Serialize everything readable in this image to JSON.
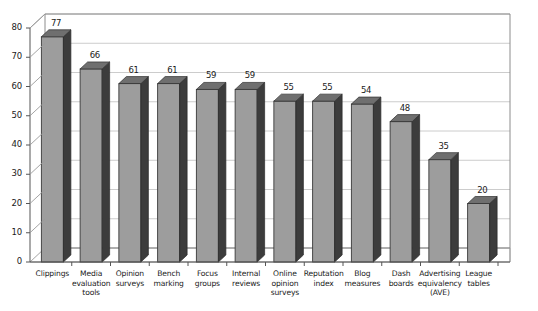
{
  "chart_data": {
    "type": "bar",
    "title": "",
    "subtitle": "",
    "xlabel": "",
    "ylabel": "",
    "ylim": [
      0,
      80
    ],
    "ytick_step": 10,
    "yticks": [
      "0",
      "10",
      "20",
      "30",
      "40",
      "50",
      "60",
      "70",
      "80"
    ],
    "grid": true,
    "legend": "none",
    "style": "3d-bar",
    "categories": [
      "Clippings",
      "Media\nevaluation\ntools",
      "Opinion\nsurveys",
      "Bench\nmarking",
      "Focus\ngroups",
      "Internal\nreviews",
      "Online\nopinion\nsurveys",
      "Reputation\nindex",
      "Blog\nmeasures",
      "Dash\nboards",
      "Advertising\nequivalency\n(AVE)",
      "League\ntables"
    ],
    "values": [
      77,
      66,
      61,
      61,
      59,
      59,
      55,
      55,
      54,
      48,
      35,
      20
    ],
    "value_labels": [
      "77",
      "66",
      "61",
      "61",
      "59",
      "59",
      "55",
      "55",
      "54",
      "48",
      "35",
      "20"
    ],
    "colors": {
      "bar_front": "#9d9d9d",
      "bar_side": "#3c3c3c",
      "bar_top": "#6f6f6f",
      "gridline": "#bfbfbf",
      "axis": "#555555",
      "frame": "#8c8c8c",
      "background": "#ffffff",
      "text": "#1a1a1a"
    }
  }
}
